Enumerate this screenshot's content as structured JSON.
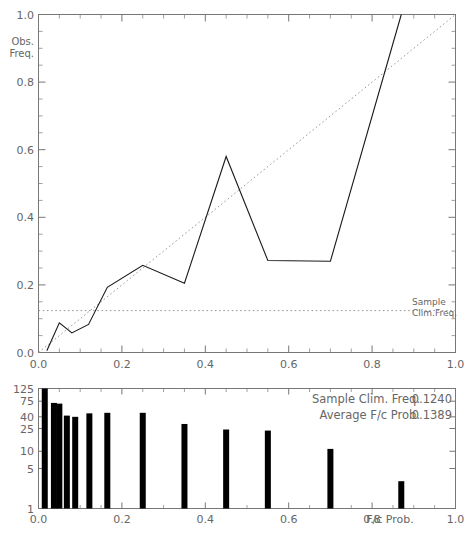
{
  "chart_data": [
    {
      "type": "line",
      "title": "",
      "xlabel": "",
      "ylabel": "Obs. Freq.",
      "xlim": [
        0.0,
        1.0
      ],
      "ylim": [
        0.0,
        1.0
      ],
      "grid": false,
      "xticks": [
        "0.0",
        "0.2",
        "0.4",
        "0.6",
        "0.8",
        "1.0"
      ],
      "xtick_values": [
        0.0,
        0.2,
        0.4,
        0.6,
        0.8,
        1.0
      ],
      "yticks": [
        "0.0",
        "0.2",
        "0.4",
        "0.6",
        "0.8",
        "1.0"
      ],
      "ytick_values": [
        0.0,
        0.2,
        0.4,
        0.6,
        0.8,
        1.0
      ],
      "minor_tick_step": 0.05,
      "series": [
        {
          "name": "Reliability curve",
          "style": "solid",
          "x": [
            0.02,
            0.05,
            0.08,
            0.12,
            0.165,
            0.25,
            0.35,
            0.45,
            0.55,
            0.7,
            0.87
          ],
          "y": [
            0.005,
            0.088,
            0.058,
            0.083,
            0.193,
            0.258,
            0.205,
            0.58,
            0.272,
            0.27,
            1.0
          ]
        },
        {
          "name": "Perfect reliability diagonal",
          "style": "dotted",
          "x": [
            0.0,
            1.0
          ],
          "y": [
            0.0,
            1.0
          ]
        },
        {
          "name": "Sample Clim.Freq. line",
          "style": "dotted",
          "x": [
            0.0,
            1.0
          ],
          "y": [
            0.124,
            0.124
          ]
        }
      ],
      "annotations": [
        {
          "name": "sample-clim-freq-label",
          "line1": "Sample",
          "line2": "Clim.Freq.",
          "y": 0.124
        }
      ]
    },
    {
      "type": "bar",
      "title": "",
      "xlabel": "F/c Prob.",
      "ylabel": "",
      "yscale": "log",
      "xlim": [
        0.0,
        1.0
      ],
      "ylim": [
        1,
        125
      ],
      "xticks": [
        "0.0",
        "0.2",
        "0.4",
        "0.6",
        "0.8",
        "1.0"
      ],
      "xtick_values": [
        0.0,
        0.2,
        0.4,
        0.6,
        0.8,
        1.0
      ],
      "yticks": [
        "1",
        "5",
        "10",
        "25",
        "40",
        "75",
        "125"
      ],
      "ytick_values": [
        1,
        5,
        10,
        25,
        40,
        75,
        125
      ],
      "categories": [
        0.02,
        0.05,
        0.08,
        0.12,
        0.165,
        0.25,
        0.35,
        0.45,
        0.55,
        0.7,
        0.87
      ],
      "values": [
        125,
        70,
        68,
        42,
        40,
        46,
        47,
        30,
        24,
        23,
        11,
        3
      ],
      "bars": [
        {
          "x": 0.015,
          "count": 125
        },
        {
          "x": 0.037,
          "count": 70
        },
        {
          "x": 0.05,
          "count": 68
        },
        {
          "x": 0.068,
          "count": 42
        },
        {
          "x": 0.088,
          "count": 40
        },
        {
          "x": 0.122,
          "count": 46
        },
        {
          "x": 0.165,
          "count": 47
        },
        {
          "x": 0.25,
          "count": 47
        },
        {
          "x": 0.35,
          "count": 30
        },
        {
          "x": 0.45,
          "count": 24
        },
        {
          "x": 0.55,
          "count": 23
        },
        {
          "x": 0.7,
          "count": 11
        },
        {
          "x": 0.87,
          "count": 3
        }
      ],
      "stats": [
        {
          "label": "Sample Clim. Freq.",
          "value": "0.1240"
        },
        {
          "label": "Average F/c Prob.",
          "value": "0.1389"
        }
      ]
    }
  ],
  "upper_panel": {
    "y_axis_name_line1": "Obs.",
    "y_axis_name_line2": "Freq.",
    "ytick_labels": [
      "1.0",
      "0.8",
      "0.6",
      "0.4",
      "0.2",
      "0.0"
    ],
    "xtick_labels": [
      "0.0",
      "0.2",
      "0.4",
      "0.6",
      "0.8",
      "1.0"
    ],
    "clim_label_line1": "Sample",
    "clim_label_line2": "Clim.Freq."
  },
  "lower_panel": {
    "ytick_labels": [
      "125",
      "75",
      "40",
      "25",
      "10",
      "5",
      "1"
    ],
    "xtick_labels": [
      "0.0",
      "0.2",
      "0.4",
      "0.6",
      "0.8",
      "1.0"
    ],
    "x_axis_name": "F/c Prob.",
    "stat1_label": "Sample Clim. Freq.",
    "stat1_value": "0.1240",
    "stat2_label": "Average F/c Prob.",
    "stat2_value": "0.1389"
  },
  "colors": {
    "line": "#1a1a1a",
    "dotted": "#999999",
    "axis": "#777777",
    "text": "#666666",
    "bar": "#000000",
    "background": "#ffffff"
  }
}
